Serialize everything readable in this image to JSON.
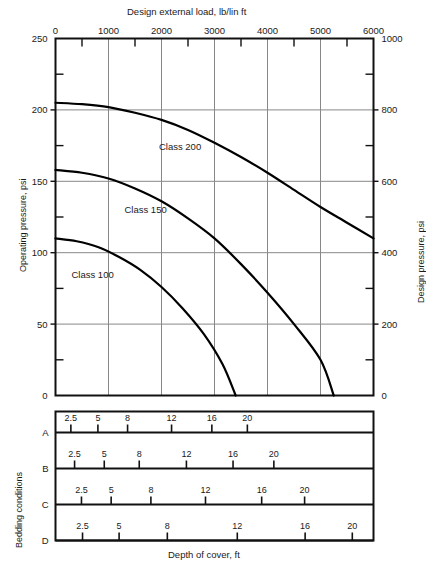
{
  "figure": {
    "top_axis_title": "Design external load, lb/lin ft",
    "left_axis_title": "Operating pressure, psi",
    "right_axis_title": "Design pressure, psi",
    "bottom_axis_title": "Depth of cover, ft",
    "bedding_group_title": "Bedding conditions"
  },
  "chart_data": {
    "type": "line",
    "title": "",
    "xlabel": "Design external load, lb/lin ft",
    "ylabel": "Operating pressure, psi",
    "y2label": "Design pressure, psi",
    "xlim": [
      0,
      6000
    ],
    "ylim": [
      0,
      250
    ],
    "y2lim": [
      0,
      1000
    ],
    "x_ticks": [
      0,
      1000,
      2000,
      3000,
      4000,
      5000,
      6000
    ],
    "x_minor_step": 500,
    "y_ticks": [
      0,
      50,
      100,
      150,
      200,
      250
    ],
    "y_minor_step": 25,
    "y2_ticks": [
      0,
      200,
      400,
      600,
      800,
      1000
    ],
    "y2_minor_step": 100,
    "grid": "major-xy",
    "legend": "inline-labels",
    "series": [
      {
        "name": "Class 200",
        "label": "Class 200",
        "label_x": 2350,
        "label_y": 172,
        "points": [
          [
            0,
            205
          ],
          [
            500,
            204
          ],
          [
            1000,
            202
          ],
          [
            1500,
            198
          ],
          [
            2000,
            193
          ],
          [
            2500,
            186
          ],
          [
            3000,
            177
          ],
          [
            3500,
            167
          ],
          [
            4000,
            156
          ],
          [
            4500,
            144
          ],
          [
            5000,
            132
          ],
          [
            5500,
            121
          ],
          [
            6000,
            110
          ]
        ]
      },
      {
        "name": "Class 150",
        "label": "Class 150",
        "label_x": 1700,
        "label_y": 128,
        "points": [
          [
            0,
            158
          ],
          [
            500,
            156
          ],
          [
            1000,
            152
          ],
          [
            1500,
            145
          ],
          [
            2000,
            136
          ],
          [
            2500,
            124
          ],
          [
            3000,
            110
          ],
          [
            3500,
            92
          ],
          [
            4000,
            72
          ],
          [
            4500,
            50
          ],
          [
            5000,
            25
          ],
          [
            5250,
            0
          ]
        ]
      },
      {
        "name": "Class 100",
        "label": "Class 100",
        "label_x": 700,
        "label_y": 82,
        "points": [
          [
            0,
            110
          ],
          [
            400,
            108
          ],
          [
            800,
            104
          ],
          [
            1200,
            97
          ],
          [
            1600,
            88
          ],
          [
            2000,
            76
          ],
          [
            2400,
            61
          ],
          [
            2800,
            43
          ],
          [
            3150,
            22
          ],
          [
            3400,
            0
          ]
        ]
      }
    ]
  },
  "bedding": {
    "title": "Bedding conditions",
    "rows": [
      {
        "id": "A",
        "label": "A",
        "ticks": [
          {
            "label": "2.5",
            "load": 290
          },
          {
            "label": "5",
            "load": 800
          },
          {
            "label": "8",
            "load": 1360
          },
          {
            "label": "12",
            "load": 2190
          },
          {
            "label": "16",
            "load": 2950
          },
          {
            "label": "20",
            "load": 3620
          }
        ]
      },
      {
        "id": "B",
        "label": "B",
        "ticks": [
          {
            "label": "2.5",
            "load": 360
          },
          {
            "label": "5",
            "load": 920
          },
          {
            "label": "8",
            "load": 1580
          },
          {
            "label": "12",
            "load": 2470
          },
          {
            "label": "16",
            "load": 3350
          },
          {
            "label": "20",
            "load": 4120
          }
        ]
      },
      {
        "id": "C",
        "label": "C",
        "ticks": [
          {
            "label": "2.5",
            "load": 490
          },
          {
            "label": "5",
            "load": 1050
          },
          {
            "label": "8",
            "load": 1800
          },
          {
            "label": "12",
            "load": 2830
          },
          {
            "label": "16",
            "load": 3890
          },
          {
            "label": "20",
            "load": 4700
          }
        ]
      },
      {
        "id": "D",
        "label": "D",
        "ticks": [
          {
            "label": "2.5",
            "load": 510
          },
          {
            "label": "5",
            "load": 1200
          },
          {
            "label": "8",
            "load": 2110
          },
          {
            "label": "12",
            "load": 3430
          },
          {
            "label": "16",
            "load": 4710
          },
          {
            "label": "20",
            "load": 5600
          }
        ]
      }
    ]
  }
}
